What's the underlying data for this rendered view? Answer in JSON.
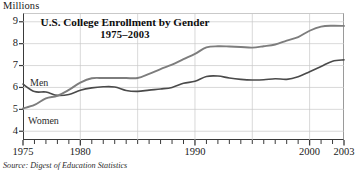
{
  "figure": {
    "unit_label": "Millions",
    "title": "U.S. College Enrollment by Gender",
    "subtitle": "1975–2003",
    "source_note": "Source: Digest of Education Statistics",
    "series_labels": {
      "men": "Men",
      "women": "Women"
    },
    "colors": {
      "men_line": "#4a4a4a",
      "women_line": "#7d7d7d",
      "grid": "#c9c9c9",
      "axis": "#3a3a3a",
      "text": "#111111",
      "background": "#ffffff"
    }
  },
  "chart_data": {
    "type": "line",
    "title": "U.S. College Enrollment by Gender",
    "subtitle": "1975–2003",
    "xlabel": "",
    "ylabel": "Millions",
    "xlim": [
      1975,
      2003
    ],
    "ylim": [
      3.6,
      9.4
    ],
    "grid": true,
    "legend_position": "inline-annotations",
    "y_ticks": [
      4,
      5,
      6,
      7,
      8,
      9
    ],
    "x_ticks": [
      1975,
      1980,
      1990,
      2000,
      2003
    ],
    "x_tick_minor_interval": 1,
    "x_gridlines": [
      1980,
      1985,
      1990,
      1995,
      2000
    ],
    "annotations": [
      {
        "text": "Men",
        "x": 1977,
        "y": 6.35
      },
      {
        "text": "Women",
        "x": 1976,
        "y": 4.75
      }
    ],
    "x": [
      1975,
      1976,
      1977,
      1978,
      1979,
      1980,
      1981,
      1982,
      1983,
      1984,
      1985,
      1986,
      1987,
      1988,
      1989,
      1990,
      1991,
      1992,
      1993,
      1994,
      1995,
      1996,
      1997,
      1998,
      1999,
      2000,
      2001,
      2002,
      2003
    ],
    "series": [
      {
        "name": "Men",
        "color": "#4a4a4a",
        "values": [
          6.15,
          5.81,
          5.79,
          5.64,
          5.68,
          5.87,
          5.98,
          6.03,
          6.02,
          5.86,
          5.82,
          5.88,
          5.93,
          6.0,
          6.19,
          6.28,
          6.5,
          6.52,
          6.43,
          6.37,
          6.34,
          6.35,
          6.4,
          6.37,
          6.49,
          6.72,
          6.96,
          7.2,
          7.26
        ]
      },
      {
        "name": "Women",
        "color": "#7d7d7d",
        "values": [
          5.04,
          5.2,
          5.5,
          5.62,
          5.89,
          6.22,
          6.42,
          6.43,
          6.43,
          6.43,
          6.43,
          6.62,
          6.84,
          7.04,
          7.29,
          7.53,
          7.83,
          7.88,
          7.87,
          7.85,
          7.82,
          7.88,
          7.96,
          8.14,
          8.3,
          8.59,
          8.78,
          8.82,
          8.81
        ]
      }
    ]
  }
}
